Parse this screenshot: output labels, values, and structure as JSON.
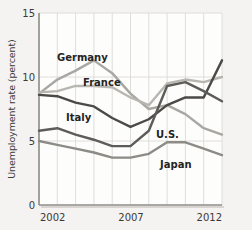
{
  "chart_data": {
    "type": "line",
    "title": "",
    "xlabel": "",
    "ylabel": "Unemployment rate (percent)",
    "ylim": [
      0,
      15
    ],
    "yticks": [
      0,
      5,
      10,
      15
    ],
    "ytick_labels": [
      "0",
      "5",
      "10",
      "15"
    ],
    "xlim": [
      2002,
      2012
    ],
    "x": [
      2002,
      2003,
      2004,
      2005,
      2006,
      2007,
      2008,
      2009,
      2010,
      2011,
      2012
    ],
    "xticks": [
      2002,
      2007,
      2012
    ],
    "xtick_labels": [
      "2002",
      "2007",
      "2012"
    ],
    "grid": "vertical-and-horizontal",
    "legend": "inline-labels",
    "series": [
      {
        "name": "Germany",
        "color": "#a9a7a2",
        "label_position": "upper-left",
        "values": [
          8.7,
          9.8,
          10.5,
          11.3,
          10.3,
          8.7,
          7.5,
          7.8,
          7.1,
          6.0,
          5.5
        ]
      },
      {
        "name": "France",
        "color": "#b8b6b1",
        "label_position": "upper-center-left",
        "values": [
          8.8,
          8.9,
          9.3,
          9.3,
          9.2,
          8.4,
          7.8,
          9.5,
          9.8,
          9.6,
          10.0
        ]
      },
      {
        "name": "Italy",
        "color": "#4b4a47",
        "label_position": "center-left",
        "values": [
          8.6,
          8.5,
          8.0,
          7.7,
          6.8,
          6.1,
          6.7,
          7.8,
          8.4,
          8.4,
          11.3
        ]
      },
      {
        "name": "U.S.",
        "color": "#5d5c58",
        "label_position": "center-right",
        "values": [
          5.8,
          6.0,
          5.5,
          5.1,
          4.6,
          4.6,
          5.8,
          9.3,
          9.6,
          8.9,
          8.1
        ]
      },
      {
        "name": "Japan",
        "color": "#8d8b86",
        "label_position": "lower-right",
        "values": [
          5.0,
          4.7,
          4.4,
          4.1,
          3.7,
          3.7,
          4.0,
          4.9,
          4.9,
          4.4,
          3.9
        ]
      }
    ]
  },
  "labels": {
    "germany": "Germany",
    "france": "France",
    "italy": "Italy",
    "us": "U.S.",
    "japan": "Japan",
    "y_axis_title": "Unemployment rate (percent)",
    "y_tick_15": "15",
    "y_tick_10": "10",
    "y_tick_5": "5",
    "y_tick_0": "0",
    "x_tick_2002": "2002",
    "x_tick_2007": "2007",
    "x_tick_2012": "2012"
  },
  "colors": {
    "background": "#f4f3f1",
    "plot_background": "#fdfdfc",
    "grid": "#d8d6d2",
    "axis": "#8f8d88",
    "text": "#3b3a38"
  }
}
